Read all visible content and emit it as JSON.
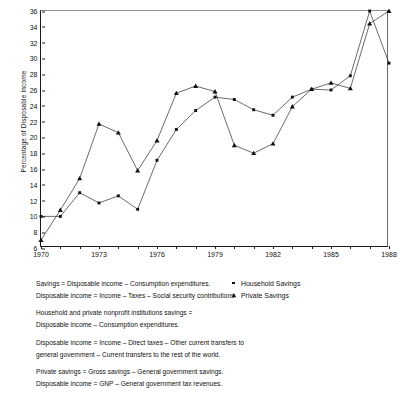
{
  "chart_data": {
    "type": "line",
    "title": "",
    "xlabel": "",
    "ylabel": "Percentage of Disposable Income",
    "xlim": [
      1970,
      1988
    ],
    "ylim": [
      6,
      36
    ],
    "ytick_step": 2,
    "yticks": [
      6,
      8,
      10,
      12,
      14,
      16,
      18,
      20,
      22,
      24,
      26,
      28,
      30,
      32,
      34,
      36
    ],
    "xticks_labeled": [
      1970,
      1973,
      1976,
      1979,
      1982,
      1985,
      1988
    ],
    "xticks_all": [
      1970,
      1971,
      1972,
      1973,
      1974,
      1975,
      1976,
      1977,
      1978,
      1979,
      1980,
      1981,
      1982,
      1983,
      1984,
      1985,
      1986,
      1987,
      1988
    ],
    "x": [
      1970,
      1971,
      1972,
      1973,
      1974,
      1975,
      1976,
      1977,
      1978,
      1979,
      1980,
      1981,
      1982,
      1983,
      1984,
      1985,
      1986,
      1987,
      1988
    ],
    "grid": false,
    "legend_position": "below-right",
    "series": [
      {
        "name": "Household Savings",
        "marker": "square",
        "values": [
          10.0,
          10.0,
          13.0,
          11.7,
          12.6,
          10.9,
          17.1,
          21.0,
          23.4,
          25.1,
          24.8,
          23.5,
          22.8,
          25.1,
          26.1,
          26.0,
          27.8,
          36.0,
          29.4
        ]
      },
      {
        "name": "Private Savings",
        "marker": "triangle",
        "values": [
          7.0,
          10.8,
          14.8,
          21.7,
          20.6,
          15.8,
          19.6,
          25.6,
          26.5,
          25.8,
          19.0,
          18.0,
          19.2,
          23.9,
          26.1,
          26.9,
          26.2,
          34.4,
          36.0
        ]
      }
    ]
  },
  "legend": {
    "items": [
      {
        "label": "Household Savings",
        "marker": "square"
      },
      {
        "label": "Private Savings",
        "marker": "triangle"
      }
    ]
  },
  "notes": [
    [
      "Savings = Disposable income – Consumption expenditures.",
      "Disposable income = Income – Taxes – Social security contributions."
    ],
    [
      "Household and private nonprofit institutions savings =",
      "Disposable income – Consumption expenditures."
    ],
    [
      "Disposable income = Income – Direct taxes – Other current transfers to",
      "general government – Current transfers to the rest of the world."
    ],
    [
      "Private savings = Gross savings – General government savings.",
      "Disposable income = GNP – General government tax revenues."
    ]
  ]
}
